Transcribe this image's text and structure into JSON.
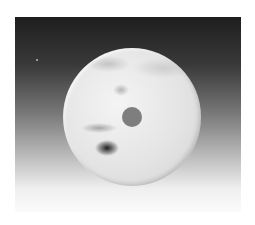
{
  "image": {
    "subject": "jade bi disc",
    "description": "Photograph of a pale mottled white/grey jade disc with a central circular hole and a dark inclusion on the lower left, on a dark-to-white vertical gradient background",
    "colors": {
      "background_top": "#1e1e1e",
      "background_bottom": "#fbfbfb",
      "disc": "#e4e4e4",
      "hole": "#7e7e7e",
      "inclusion": "#1a1a1a",
      "page": "#ffffff"
    }
  },
  "caption": ""
}
